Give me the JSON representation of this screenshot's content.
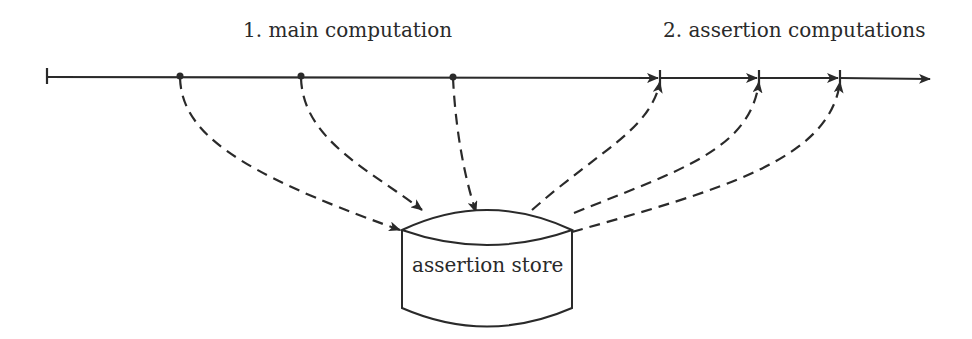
{
  "diagram": {
    "phase_labels": {
      "main": "1. main computation",
      "assertions": "2. assertion computations"
    },
    "store_label": "assertion store",
    "timeline": {
      "direction": "left-to-right",
      "main_points": 3,
      "assertion_points": 3
    },
    "edges": [
      {
        "from": "main-point-1",
        "to": "assertion-store",
        "style": "dashed"
      },
      {
        "from": "main-point-2",
        "to": "assertion-store",
        "style": "dashed"
      },
      {
        "from": "main-point-3",
        "to": "assertion-store",
        "style": "dashed"
      },
      {
        "from": "assertion-store",
        "to": "assertion-point-1",
        "style": "dashed"
      },
      {
        "from": "assertion-store",
        "to": "assertion-point-2",
        "style": "dashed"
      },
      {
        "from": "assertion-store",
        "to": "assertion-point-3",
        "style": "dashed"
      }
    ],
    "colors": {
      "stroke": "#2a2a2a",
      "background": "#ffffff"
    }
  }
}
